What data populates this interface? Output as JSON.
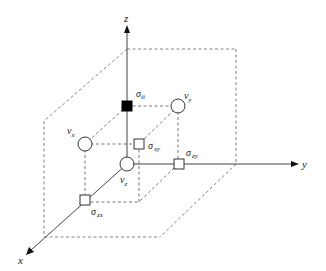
{
  "axes": {
    "x": {
      "label": "x"
    },
    "y": {
      "label": "y"
    },
    "z": {
      "label": "z"
    }
  },
  "nodes": {
    "sigma_ii": {
      "symbol": "σ",
      "subscript": "ii",
      "shape": "filled-square"
    },
    "v_x": {
      "symbol": "v",
      "subscript": "x",
      "shape": "circle"
    },
    "v_y": {
      "symbol": "v",
      "subscript": "y",
      "shape": "circle"
    },
    "v_z": {
      "symbol": "v",
      "subscript": "z",
      "shape": "circle"
    },
    "sigma_xy": {
      "symbol": "σ",
      "subscript": "xy",
      "shape": "square"
    },
    "sigma_zy": {
      "symbol": "σ",
      "subscript": "zy",
      "shape": "square"
    },
    "sigma_zx": {
      "symbol": "σ",
      "subscript": "zx",
      "shape": "square"
    }
  },
  "colors": {
    "axis": "#444444",
    "dashed": "#777777",
    "filled_node": "#000000"
  }
}
